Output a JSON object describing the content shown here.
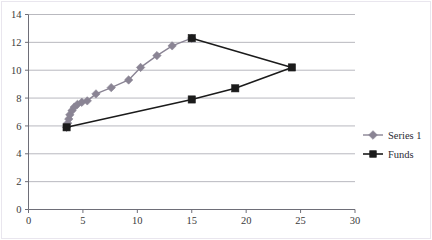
{
  "chart_data": {
    "type": "line",
    "title": "",
    "xlabel": "",
    "ylabel": "",
    "xlim": [
      0,
      30
    ],
    "ylim": [
      0,
      14
    ],
    "xticks": [
      0,
      5,
      10,
      15,
      20,
      25,
      30
    ],
    "yticks": [
      0,
      2,
      4,
      6,
      8,
      10,
      12,
      14
    ],
    "grid": "horizontal",
    "legend_position": "right",
    "series": [
      {
        "name": "Series 1",
        "color": "#8a8494",
        "marker": "diamond",
        "points": [
          [
            3.5,
            5.9
          ],
          [
            3.6,
            6.2
          ],
          [
            3.7,
            6.5
          ],
          [
            3.8,
            6.8
          ],
          [
            4.0,
            7.1
          ],
          [
            4.2,
            7.35
          ],
          [
            4.5,
            7.55
          ],
          [
            4.9,
            7.7
          ],
          [
            5.4,
            7.8
          ],
          [
            6.2,
            8.3
          ],
          [
            7.6,
            8.75
          ],
          [
            9.2,
            9.3
          ],
          [
            10.3,
            10.2
          ],
          [
            11.8,
            11.05
          ],
          [
            13.2,
            11.75
          ],
          [
            15.0,
            12.3
          ]
        ]
      },
      {
        "name": "Funds",
        "color": "#1b1b1b",
        "marker": "square",
        "points": [
          [
            3.5,
            5.9
          ],
          [
            15.0,
            7.9
          ],
          [
            19.0,
            8.7
          ],
          [
            24.2,
            10.2
          ],
          [
            15.0,
            12.3
          ]
        ]
      }
    ]
  },
  "legend": {
    "entries": [
      {
        "label": "Series 1",
        "color": "#8a8494",
        "marker": "diamond"
      },
      {
        "label": "Funds",
        "color": "#1b1b1b",
        "marker": "square"
      }
    ]
  },
  "axes": {
    "y_labels": [
      "0",
      "2",
      "4",
      "6",
      "8",
      "10",
      "12",
      "14"
    ],
    "x_labels": [
      "0",
      "5",
      "10",
      "15",
      "20",
      "25",
      "30"
    ]
  },
  "colors": {
    "gridline": "#b9b9bf",
    "axis": "#6e6e78",
    "series1": "#8a8494",
    "funds": "#1b1b1b",
    "frame": "#e9e6ee",
    "text": "#3a3a3a"
  }
}
